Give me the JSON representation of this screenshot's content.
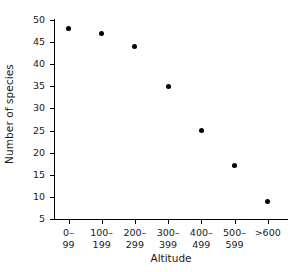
{
  "chart_data": {
    "type": "scatter",
    "title": "",
    "xlabel": "Altitude",
    "ylabel": "Number of species",
    "categories": [
      "0–\n99",
      "100–\n199",
      "200–\n299",
      "300–\n399",
      "400–\n499",
      "500–\n599",
      ">600"
    ],
    "category_lines": [
      {
        "line1": "0–",
        "line2": "99"
      },
      {
        "line1": "100–",
        "line2": "199"
      },
      {
        "line1": "200–",
        "line2": "299"
      },
      {
        "line1": "300–",
        "line2": "399"
      },
      {
        "line1": "400–",
        "line2": "499"
      },
      {
        "line1": "500–",
        "line2": "599"
      },
      {
        "line1": ">600",
        "line2": ""
      }
    ],
    "values": [
      48,
      47,
      44,
      35,
      25,
      17,
      9
    ],
    "ylim": [
      5,
      50
    ],
    "yticks": [
      50,
      45,
      40,
      35,
      30,
      25,
      20,
      15,
      10,
      5
    ],
    "ytick_labels": [
      "50",
      "45",
      "40",
      "35",
      "30",
      "25",
      "20",
      "15",
      "10",
      "5"
    ],
    "grid": false,
    "legend": null,
    "marker": {
      "shape": "circle",
      "filled": true,
      "color": "#000000",
      "size": 5
    },
    "axis_color": "#000000",
    "background_color": "#ffffff"
  }
}
